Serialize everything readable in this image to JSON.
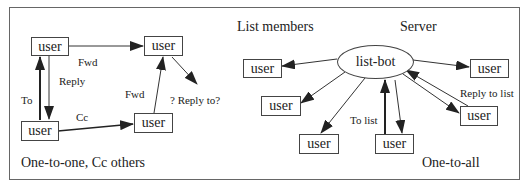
{
  "left_panel": {
    "caption": "One-to-one, Cc others",
    "nodes": {
      "top_left": "user",
      "top_right": "user",
      "bottom_left": "user",
      "middle": "user"
    },
    "edge_labels": {
      "fwd_top": "Fwd",
      "reply": "Reply",
      "to": "To",
      "cc": "Cc",
      "fwd_middle": "Fwd",
      "reply_to_question": "? Reply to?"
    }
  },
  "right_panel": {
    "caption": "One-to-all",
    "heading_members": "List members",
    "heading_server": "Server",
    "server_node": "list-bot",
    "nodes": {
      "left_1": "user",
      "left_2": "user",
      "left_3": "user",
      "bottom": "user",
      "right_1": "user",
      "right_2": "user"
    },
    "edge_labels": {
      "to_list": "To list",
      "reply_to_list": "Reply to list"
    }
  }
}
